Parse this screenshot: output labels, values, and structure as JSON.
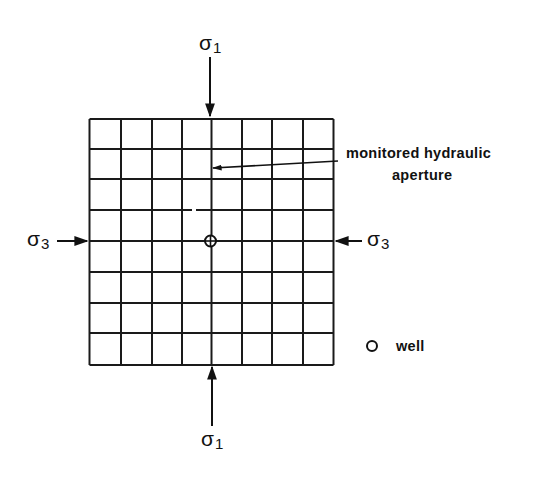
{
  "stress_labels": {
    "top": {
      "symbol": "σ",
      "subscript": "1"
    },
    "bottom": {
      "symbol": "σ",
      "subscript": "1"
    },
    "left": {
      "symbol": "σ",
      "subscript": "3"
    },
    "right": {
      "symbol": "σ",
      "subscript": "3"
    }
  },
  "annotation": {
    "line1": "monitored hydraulic",
    "line2": "aperture"
  },
  "legend": {
    "well_icon": "open-circle-icon",
    "well_label": "well"
  },
  "grid": {
    "rows": 8,
    "cols": 8,
    "line_color": "#1a1a1a"
  }
}
